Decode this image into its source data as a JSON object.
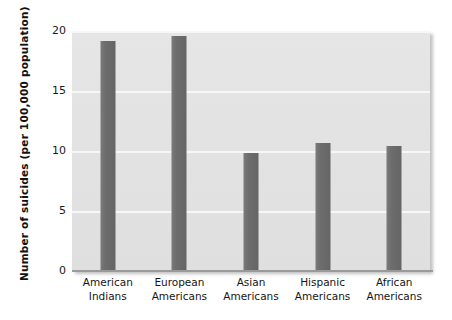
{
  "chart_data": {
    "type": "bar",
    "title": "",
    "subtitle": "",
    "xlabel": "",
    "ylabel": "Number of suicides (per 100,000 population)",
    "categories": [
      "American Indians",
      "European Americans",
      "Asian Americans",
      "Hispanic Americans",
      "African Americans"
    ],
    "category_lines": [
      [
        "American",
        "Indians"
      ],
      [
        "European",
        "Americans"
      ],
      [
        "Asian",
        "Americans"
      ],
      [
        "Hispanic",
        "Americans"
      ],
      [
        "African",
        "Americans"
      ]
    ],
    "values": [
      19.2,
      19.6,
      9.8,
      10.7,
      10.4
    ],
    "ylim": [
      0,
      20
    ],
    "yticks": [
      0,
      5,
      10,
      15,
      20
    ],
    "ytick_labels": [
      "0",
      "5",
      "10",
      "15",
      "20"
    ],
    "grid": "horizontal",
    "legend": "none",
    "colors": {
      "bar": "#6d6d6d",
      "plot_background": "#e3e3e3",
      "gridline": "#f7f7f7",
      "axis_line": "#9a9a9a",
      "text": "#151515",
      "page_background": "#ffffff"
    }
  }
}
